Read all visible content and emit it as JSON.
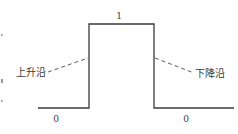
{
  "diagram": {
    "type": "pulse-waveform",
    "high_level_label": "1",
    "low_level_labels": [
      "0",
      "0"
    ],
    "rising_edge_label": "上升沿",
    "falling_edge_label": "下降沿",
    "colors": {
      "line": "#3a3a3a",
      "text": "#3a3a3a",
      "background": "#ffffff"
    }
  }
}
